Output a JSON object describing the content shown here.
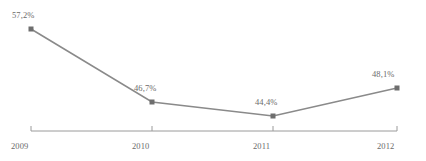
{
  "chart_data": {
    "type": "line",
    "title": "",
    "subtitle": "",
    "xlabel": "",
    "ylabel": "",
    "categories": [
      "2009",
      "2010",
      "2011",
      "2012"
    ],
    "values": [
      57.2,
      46.7,
      44.4,
      48.1
    ],
    "value_labels": [
      "57,2%",
      "46,7%",
      "44,4%",
      "48,1%"
    ],
    "tick_labels": [
      "2009",
      "2010",
      "2011",
      "2012"
    ],
    "series": [
      {
        "name": "",
        "values": [
          57.2,
          46.7,
          44.4,
          48.1
        ]
      }
    ],
    "ylim": [
      40,
      60
    ],
    "grid": false,
    "legend": false,
    "legend_position": "none",
    "decimal_separator": ",",
    "unit": "%",
    "marker": "square",
    "colors": {
      "line": "#8a8a8a",
      "marker": "#6e6e6e",
      "axis": "#9a9a9a",
      "text": "#6b6b6b",
      "background": "#ffffff"
    }
  },
  "geometry": {
    "points": [
      {
        "x": 31,
        "y": 29
      },
      {
        "x": 152,
        "y": 102
      },
      {
        "x": 273,
        "y": 116
      },
      {
        "x": 397,
        "y": 88
      }
    ],
    "axis_y": 131,
    "axis_x_start": 31,
    "axis_x_end": 397,
    "label_positions": [
      {
        "left": 12,
        "top": 11
      },
      {
        "left": 134,
        "top": 84
      },
      {
        "left": 255,
        "top": 98
      },
      {
        "left": 372,
        "top": 70
      }
    ],
    "tick_label_positions": [
      {
        "left": 11,
        "top": 142
      },
      {
        "left": 132,
        "top": 142
      },
      {
        "left": 253,
        "top": 142
      },
      {
        "left": 377,
        "top": 142
      }
    ]
  }
}
